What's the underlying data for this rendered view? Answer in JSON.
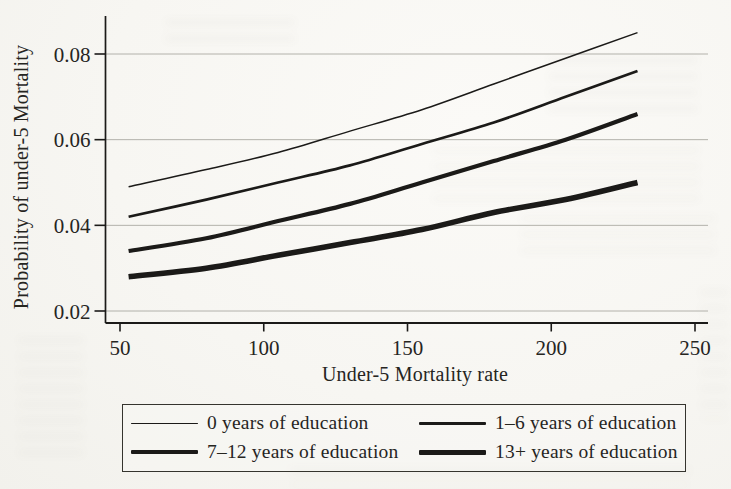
{
  "page": {
    "background": "#f7f6f2",
    "ink": "#1b1a18",
    "grid_color": "#a6a59e",
    "text_color": "#26251f"
  },
  "chart_data": {
    "type": "line",
    "title": "",
    "xlabel": "Under-5 Mortality rate",
    "ylabel": "Probability of under-5 Mortality",
    "xlim": [
      50,
      250
    ],
    "ylim": [
      0.02,
      0.088
    ],
    "xticks": [
      50,
      100,
      150,
      200,
      250
    ],
    "xtick_labels": [
      "50",
      "100",
      "150",
      "200",
      "250"
    ],
    "ytick_values": [
      0.02,
      0.04,
      0.06,
      0.08
    ],
    "ytick_labels": [
      "0.02",
      "0.04",
      "0.06",
      "0.08"
    ],
    "grid": "horizontal gridlines at y ticks, no top/right frame",
    "legend_position": "boxed legend below chart, 2 columns x 2 rows",
    "x": [
      53,
      80,
      105,
      130,
      155,
      180,
      205,
      230
    ],
    "series": [
      {
        "name": "0 years of education",
        "values": [
          0.049,
          0.053,
          0.057,
          0.062,
          0.067,
          0.073,
          0.079,
          0.085
        ],
        "stroke_width": 1.5
      },
      {
        "name": "1–6 years of education",
        "values": [
          0.042,
          0.046,
          0.05,
          0.054,
          0.059,
          0.064,
          0.07,
          0.076
        ],
        "stroke_width": 2.7
      },
      {
        "name": "7–12 years of education",
        "values": [
          0.034,
          0.037,
          0.041,
          0.045,
          0.05,
          0.055,
          0.06,
          0.066
        ],
        "stroke_width": 4.2
      },
      {
        "name": "13+ years of education",
        "values": [
          0.028,
          0.03,
          0.033,
          0.036,
          0.039,
          0.043,
          0.046,
          0.05
        ],
        "stroke_width": 5.6
      }
    ]
  }
}
